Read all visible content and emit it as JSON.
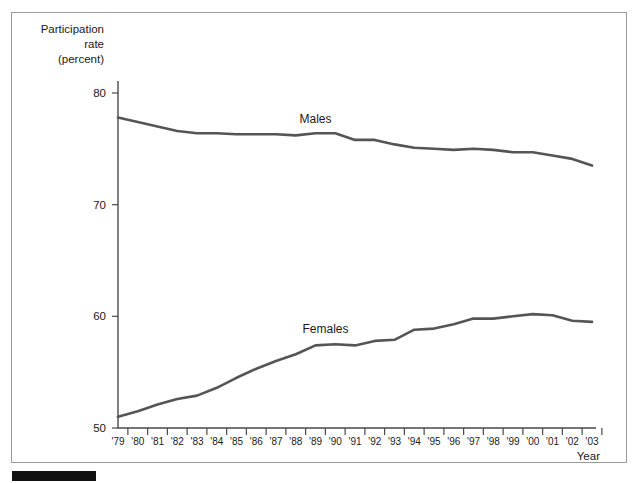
{
  "figure": {
    "y_axis_title_lines": [
      "Participation",
      "rate",
      "(percent)"
    ],
    "x_axis_title": "Year"
  },
  "chart_data": {
    "type": "line",
    "title": "",
    "subtitle": "",
    "xlabel": "Year",
    "ylabel": "Participation rate (percent)",
    "categories": [
      "'79",
      "'80",
      "'81",
      "'82",
      "'83",
      "'84",
      "'85",
      "'86",
      "'87",
      "'88",
      "'89",
      "'90",
      "'91",
      "'92",
      "'93",
      "'94",
      "'95",
      "'96",
      "'97",
      "'98",
      "'99",
      "'00",
      "'01",
      "'02",
      "'03"
    ],
    "x": [
      1979,
      1980,
      1981,
      1982,
      1983,
      1984,
      1985,
      1986,
      1987,
      1988,
      1989,
      1990,
      1991,
      1992,
      1993,
      1994,
      1995,
      1996,
      1997,
      1998,
      1999,
      2000,
      2001,
      2002,
      2003
    ],
    "series": [
      {
        "name": "Males",
        "label": "Males",
        "color": "#555555",
        "values": [
          77.8,
          77.4,
          77.0,
          76.6,
          76.4,
          76.4,
          76.3,
          76.3,
          76.3,
          76.2,
          76.4,
          76.4,
          75.8,
          75.8,
          75.4,
          75.1,
          75.0,
          74.9,
          75.0,
          74.9,
          74.7,
          74.7,
          74.4,
          74.1,
          73.5
        ],
        "annotation_label": "Males"
      },
      {
        "name": "Females",
        "label": "Females",
        "color": "#555555",
        "values": [
          51.0,
          51.5,
          52.1,
          52.6,
          52.9,
          53.6,
          54.5,
          55.3,
          56.0,
          56.6,
          57.4,
          57.5,
          57.4,
          57.8,
          57.9,
          58.8,
          58.9,
          59.3,
          59.8,
          59.8,
          60.0,
          60.2,
          60.1,
          59.6,
          59.5
        ]
      }
    ],
    "y_ticks": [
      50,
      60,
      70,
      80
    ],
    "ylim": [
      50,
      80
    ],
    "xlim": [
      "'79",
      "'03"
    ],
    "grid": false,
    "legend": "inline-annotations",
    "legend_position": "on-plot"
  }
}
